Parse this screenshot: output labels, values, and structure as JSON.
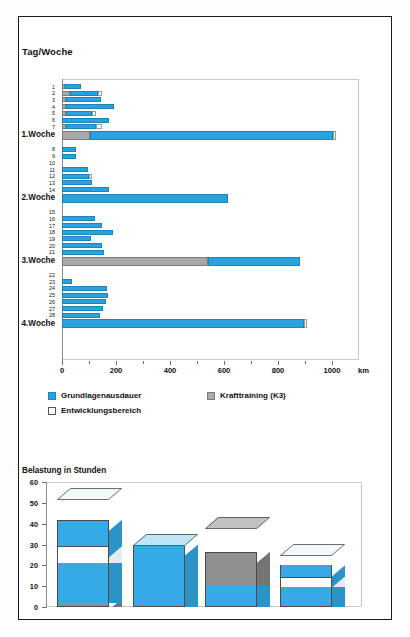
{
  "chart_data": [
    {
      "type": "bar",
      "orientation": "horizontal",
      "title": "Tag/Woche",
      "xlabel": "km",
      "ylabel": "Tag/Woche",
      "xlim": [
        0,
        1100
      ],
      "xticks": [
        0,
        200,
        400,
        600,
        800,
        1000
      ],
      "xticklabels": [
        "0",
        "200",
        "400",
        "600",
        "800",
        "1000"
      ],
      "unit": "km",
      "grid": false,
      "legend_position": "below",
      "series": [
        {
          "name": "Grundlagenausdauer",
          "color": "#29a3e0"
        },
        {
          "name": "Krafttraining (K3)",
          "color": "#a9a9a9"
        },
        {
          "name": "Entwicklungsbereich",
          "color": "#ffffff"
        }
      ],
      "categories": [
        "1",
        "2",
        "3",
        "4",
        "5",
        "6",
        "7",
        "1.Woche",
        "8",
        "9",
        "10",
        "11",
        "12",
        "13",
        "14",
        "2.Woche",
        "15",
        "16",
        "17",
        "18",
        "19",
        "20",
        "21",
        "3.Woche",
        "22",
        "23",
        "24",
        "25",
        "26",
        "27",
        "28",
        "4.Woche"
      ],
      "rows": [
        {
          "label": "1",
          "week": false,
          "kraft": 12,
          "gla": 58,
          "entw": 0
        },
        {
          "label": "2",
          "week": false,
          "kraft": 30,
          "gla": 105,
          "entw": 12
        },
        {
          "label": "3",
          "week": false,
          "kraft": 14,
          "gla": 131,
          "entw": 0
        },
        {
          "label": "4",
          "week": false,
          "kraft": 14,
          "gla": 178,
          "entw": 0
        },
        {
          "label": "5",
          "week": false,
          "kraft": 16,
          "gla": 95,
          "entw": 16
        },
        {
          "label": "6",
          "week": false,
          "kraft": 0,
          "gla": 173,
          "entw": 0
        },
        {
          "label": "7",
          "week": false,
          "kraft": 16,
          "gla": 110,
          "entw": 24
        },
        {
          "label": "1.Woche",
          "week": true,
          "kraft": 102,
          "gla": 900,
          "entw": 12
        },
        {
          "label": "8",
          "week": false,
          "kraft": 0,
          "gla": 52,
          "entw": 0
        },
        {
          "label": "9",
          "week": false,
          "kraft": 0,
          "gla": 50,
          "entw": 0
        },
        {
          "label": "10",
          "week": false,
          "kraft": 0,
          "gla": 0,
          "entw": 0
        },
        {
          "label": "11",
          "week": false,
          "kraft": 0,
          "gla": 95,
          "entw": 0
        },
        {
          "label": "12",
          "week": false,
          "kraft": 0,
          "gla": 101,
          "entw": 10
        },
        {
          "label": "13",
          "week": false,
          "kraft": 0,
          "gla": 112,
          "entw": 0
        },
        {
          "label": "14",
          "week": false,
          "kraft": 0,
          "gla": 174,
          "entw": 0
        },
        {
          "label": "2.Woche",
          "week": true,
          "kraft": 0,
          "gla": 614,
          "entw": 0
        },
        {
          "label": "15",
          "week": false,
          "kraft": 0,
          "gla": 0,
          "entw": 0
        },
        {
          "label": "16",
          "week": false,
          "kraft": 0,
          "gla": 124,
          "entw": 0
        },
        {
          "label": "17",
          "week": false,
          "kraft": 0,
          "gla": 148,
          "entw": 0
        },
        {
          "label": "18",
          "week": false,
          "kraft": 0,
          "gla": 188,
          "entw": 0
        },
        {
          "label": "19",
          "week": false,
          "kraft": 0,
          "gla": 106,
          "entw": 0
        },
        {
          "label": "20",
          "week": false,
          "kraft": 0,
          "gla": 148,
          "entw": 0
        },
        {
          "label": "21",
          "week": false,
          "kraft": 0,
          "gla": 154,
          "entw": 0
        },
        {
          "label": "3.Woche",
          "week": true,
          "kraft": 540,
          "gla": 340,
          "entw": 0
        },
        {
          "label": "22",
          "week": false,
          "kraft": 0,
          "gla": 0,
          "entw": 0
        },
        {
          "label": "23",
          "week": false,
          "kraft": 0,
          "gla": 36,
          "entw": 0
        },
        {
          "label": "24",
          "week": false,
          "kraft": 0,
          "gla": 166,
          "entw": 0
        },
        {
          "label": "25",
          "week": false,
          "kraft": 0,
          "gla": 171,
          "entw": 0
        },
        {
          "label": "26",
          "week": false,
          "kraft": 0,
          "gla": 164,
          "entw": 0
        },
        {
          "label": "27",
          "week": false,
          "kraft": 0,
          "gla": 152,
          "entw": 0
        },
        {
          "label": "28",
          "week": false,
          "kraft": 0,
          "gla": 139,
          "entw": 0
        },
        {
          "label": "4.Woche",
          "week": true,
          "kraft": 0,
          "gla": 898,
          "entw": 10
        }
      ]
    },
    {
      "type": "bar",
      "orientation": "vertical",
      "style": "3d-stacked",
      "title": "Belastung in Stunden",
      "ylabel": "Belastung in Stunden",
      "ylim": [
        0,
        60
      ],
      "yticks": [
        0,
        10,
        20,
        30,
        40,
        50,
        60
      ],
      "yticklabels": [
        "0",
        "10",
        "20",
        "30",
        "40",
        "50",
        "60"
      ],
      "grid": false,
      "categories": [
        "1.Woche",
        "2.Woche",
        "3.Woche",
        "4.Woche"
      ],
      "series": [
        {
          "name": "Krafttraining (K3)",
          "color": "#8f8f8f"
        },
        {
          "name": "Grundlagenausdauer",
          "color": "#35aae5"
        },
        {
          "name": "Entwicklungsbereich",
          "color": "#ffffff"
        }
      ],
      "bars": [
        {
          "label": "1.Woche",
          "kraft_bottom": 4,
          "gla": 40,
          "entw": 8,
          "kraft_top": 0,
          "total": 52
        },
        {
          "label": "2.Woche",
          "kraft_bottom": 0,
          "gla": 30,
          "entw": 0,
          "kraft_top": 0,
          "total": 30
        },
        {
          "label": "3.Woche",
          "kraft_bottom": 0,
          "gla": 22,
          "entw": 0,
          "kraft_top": 16,
          "total": 38
        },
        {
          "label": "4.Woche",
          "kraft_bottom": 0,
          "gla": 20,
          "entw": 5,
          "kraft_top": 0,
          "total": 25
        }
      ]
    }
  ],
  "top_chart": {
    "title": "Tag/Woche",
    "x_unit": "km",
    "xticklabels": [
      "0",
      "200",
      "400",
      "600",
      "800",
      "1000"
    ]
  },
  "legend": {
    "items": [
      {
        "label": "Grundlagenausdauer",
        "swatch": "gla"
      },
      {
        "label": "Krafttraining (K3)",
        "swatch": "kraft"
      },
      {
        "label": "Entwicklungsbereich",
        "swatch": "entw"
      }
    ]
  },
  "bottom_chart": {
    "title": "Belastung in Stunden",
    "yticklabels": [
      "60",
      "50",
      "40",
      "30",
      "20",
      "10",
      "0"
    ]
  }
}
